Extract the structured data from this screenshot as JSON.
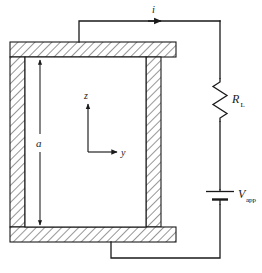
{
  "figure": {
    "type": "technical-line-diagram",
    "colors": {
      "line": "#1a1a1a",
      "hatch": "#555555",
      "background": "#ffffff",
      "wall_fill": "#f2f2f2"
    }
  },
  "labels": {
    "current": "i",
    "dimension": "a",
    "axis_vertical": "z",
    "axis_horizontal": "y",
    "resistor": "R",
    "resistor_subscript": "L",
    "source": "V",
    "source_subscript": "app"
  },
  "components": {
    "resistor": {
      "name": "load-resistor",
      "label": "R_L",
      "shape": "zigzag"
    },
    "source": {
      "name": "voltage-source",
      "label": "V_app",
      "shape": "battery"
    },
    "waveguide": {
      "name": "hatched-conductor-walls",
      "hatch_style": "diagonal-45"
    },
    "current_arrow": {
      "name": "current-direction-arrow",
      "direction": "right"
    },
    "dimension_arrow": {
      "name": "dimension-a-arrow",
      "direction": "vertical-double"
    },
    "axes": {
      "name": "coordinate-axes",
      "origin_label": ""
    }
  },
  "geometry": {
    "wall_outer": {
      "x": 10,
      "y": 42,
      "w": 166,
      "h": 186
    },
    "wall_thickness": 15,
    "top_wire_y": 21,
    "right_wire_x": 220,
    "bottom_wire_y": 258,
    "left_riser_x": 79,
    "bottom_riser_x": 111
  }
}
